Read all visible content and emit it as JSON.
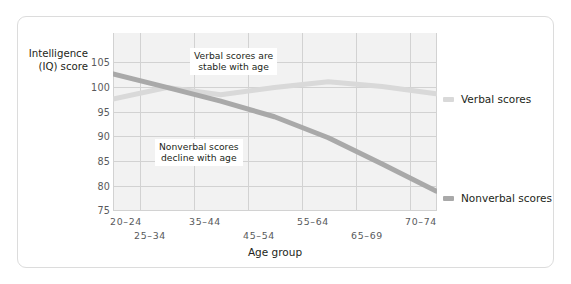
{
  "chart_data": {
    "type": "line",
    "title": "",
    "xlabel": "Age group",
    "ylabel": "Intelligence (IQ) score",
    "ylabel_line1": "Intelligence",
    "ylabel_line2": "(IQ) score",
    "categories": [
      "20–24",
      "25–34",
      "35–44",
      "45–54",
      "55–64",
      "65–69",
      "70–74"
    ],
    "yticks": [
      105,
      100,
      95,
      90,
      85,
      80,
      75
    ],
    "ylim": [
      75,
      109
    ],
    "grid": true,
    "legend_position": "right",
    "series": [
      {
        "name": "Verbal scores",
        "color": "#d9d9d9",
        "values": [
          96.4,
          98.6,
          97.2,
          98.6,
          99.7,
          98.8,
          97.4
        ]
      },
      {
        "name": "Nonverbal scores",
        "color": "#a9a9a9",
        "values": [
          101.2,
          98.6,
          96.0,
          93.0,
          89.0,
          84.0,
          78.8
        ]
      }
    ],
    "annotations": [
      {
        "id": "verbal-note",
        "line1": "Verbal scores are",
        "line2": "stable with age"
      },
      {
        "id": "nonverbal-note",
        "line1": "Nonverbal scores",
        "line2": "decline with age"
      }
    ]
  },
  "legend": {
    "verbal": "Verbal scores",
    "nonverbal": "Nonverbal scores"
  },
  "colors": {
    "verbal": "#d9d9d9",
    "nonverbal": "#a9a9a9",
    "plot_background": "#f2f2f2",
    "grid": "#d2d2d2",
    "text": "#231f20",
    "tick_text": "#58595b",
    "frame_border": "#dcdcdc"
  }
}
